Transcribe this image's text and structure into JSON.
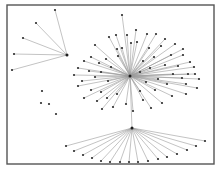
{
  "diagram": {
    "type": "network-graph",
    "frame": {
      "x": 7,
      "y": 5,
      "w": 207,
      "h": 159
    },
    "colors": {
      "edge": "#9a9a9a",
      "node": "#2b2b2b",
      "frame": "#555555",
      "background": "#ffffff"
    },
    "clusters": [
      {
        "name": "top-left-star",
        "hub": [
          67,
          55
        ],
        "leaves": [
          [
            55,
            10
          ],
          [
            36,
            23
          ],
          [
            23,
            38
          ],
          [
            14,
            54
          ],
          [
            12,
            70
          ]
        ]
      },
      {
        "name": "central-star",
        "hub": [
          130,
          76
        ],
        "leaves": [
          [
            122,
            15
          ],
          [
            116,
            35
          ],
          [
            127,
            35
          ],
          [
            136,
            30
          ],
          [
            147,
            34
          ],
          [
            156,
            34
          ],
          [
            165,
            39
          ],
          [
            109,
            37
          ],
          [
            131,
            43
          ],
          [
            122,
            48
          ],
          [
            149,
            48
          ],
          [
            161,
            46
          ],
          [
            175,
            44
          ],
          [
            183,
            49
          ],
          [
            95,
            45
          ],
          [
            117,
            49
          ],
          [
            137,
            42
          ],
          [
            154,
            57
          ],
          [
            171,
            55
          ],
          [
            183,
            55
          ],
          [
            190,
            62
          ],
          [
            91,
            57
          ],
          [
            106,
            59
          ],
          [
            118,
            56
          ],
          [
            143,
            61
          ],
          [
            165,
            65
          ],
          [
            178,
            66
          ],
          [
            194,
            67
          ],
          [
            84,
            61
          ],
          [
            99,
            63
          ],
          [
            111,
            67
          ],
          [
            150,
            68
          ],
          [
            173,
            74
          ],
          [
            188,
            74
          ],
          [
            195,
            74
          ],
          [
            78,
            68
          ],
          [
            89,
            71
          ],
          [
            101,
            72
          ],
          [
            140,
            72
          ],
          [
            158,
            79
          ],
          [
            182,
            78
          ],
          [
            199,
            79
          ],
          [
            74,
            75
          ],
          [
            82,
            81
          ],
          [
            95,
            77
          ],
          [
            108,
            81
          ],
          [
            146,
            82
          ],
          [
            167,
            84
          ],
          [
            186,
            84
          ],
          [
            197,
            88
          ],
          [
            78,
            86
          ],
          [
            91,
            90
          ],
          [
            101,
            92
          ],
          [
            117,
            94
          ],
          [
            140,
            91
          ],
          [
            155,
            90
          ],
          [
            172,
            96
          ],
          [
            186,
            94
          ],
          [
            84,
            98
          ],
          [
            97,
            101
          ],
          [
            107,
            98
          ],
          [
            126,
            104
          ],
          [
            143,
            100
          ],
          [
            162,
            103
          ],
          [
            102,
            109
          ],
          [
            113,
            107
          ],
          [
            133,
            111
          ],
          [
            151,
            108
          ]
        ]
      },
      {
        "name": "bottom-fan",
        "hub": [
          132,
          128
        ],
        "leaves": [
          [
            66,
            146
          ],
          [
            74,
            151
          ],
          [
            83,
            155
          ],
          [
            92,
            158
          ],
          [
            101,
            161
          ],
          [
            110,
            162
          ],
          [
            120,
            162
          ],
          [
            129,
            162
          ],
          [
            138,
            162
          ],
          [
            148,
            161
          ],
          [
            158,
            159
          ],
          [
            167,
            157
          ],
          [
            177,
            154
          ],
          [
            187,
            150
          ],
          [
            196,
            146
          ],
          [
            205,
            141
          ]
        ],
        "parent_edge": [
          [
            130,
            76
          ],
          [
            132,
            128
          ]
        ]
      }
    ],
    "isolated_nodes": [
      [
        42,
        91
      ],
      [
        41,
        103
      ],
      [
        49,
        104
      ],
      [
        56,
        114
      ]
    ]
  }
}
